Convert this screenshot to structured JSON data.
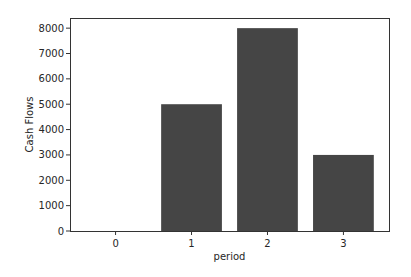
{
  "chart_data": {
    "type": "bar",
    "title": "",
    "xlabel": "period",
    "ylabel": "Cash Flows",
    "categories": [
      "0",
      "1",
      "2",
      "3"
    ],
    "x": [
      0,
      1,
      2,
      3
    ],
    "values": [
      0,
      5000,
      8000,
      3000
    ],
    "bar_width": 0.8,
    "bar_color": "#454545",
    "xlim": [
      -0.6,
      3.6
    ],
    "ylim": [
      0,
      8400
    ],
    "yticks": [
      0,
      1000,
      2000,
      3000,
      4000,
      5000,
      6000,
      7000,
      8000
    ],
    "ytick_labels": [
      "0",
      "1000",
      "2000",
      "3000",
      "4000",
      "5000",
      "6000",
      "7000",
      "8000"
    ],
    "xticks": [
      0,
      1,
      2,
      3
    ],
    "xtick_labels": [
      "0",
      "1",
      "2",
      "3"
    ],
    "grid": false,
    "legend": null
  }
}
